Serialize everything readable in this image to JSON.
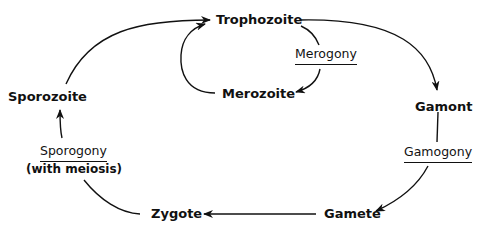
{
  "diagram": {
    "stages": {
      "trophozoite": "Trophozoite",
      "merozoite": "Merozoite",
      "gamont": "Gamont",
      "gamete": "Gamete",
      "zygote": "Zygote",
      "sporozoite": "Sporozoite"
    },
    "processes": {
      "merogony": "Merogony",
      "gamogony": "Gamogony",
      "sporogony": "Sporogony",
      "sporogony_note": "(with meiosis)"
    },
    "edges": [
      {
        "from": "Sporozoite",
        "to": "Trophozoite"
      },
      {
        "from": "Trophozoite",
        "to": "Merozoite",
        "via": "Merogony"
      },
      {
        "from": "Merozoite",
        "to": "Trophozoite"
      },
      {
        "from": "Trophozoite",
        "to": "Gamont"
      },
      {
        "from": "Gamont",
        "to": "Gamete",
        "via": "Gamogony"
      },
      {
        "from": "Gamete",
        "to": "Zygote"
      },
      {
        "from": "Zygote",
        "to": "Sporozoite",
        "via": "Sporogony (with meiosis)"
      }
    ],
    "line_color": "#111111"
  }
}
